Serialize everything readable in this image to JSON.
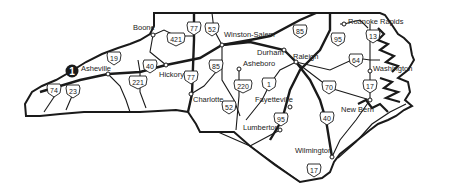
{
  "map": {
    "region": "North Carolina",
    "colors": {
      "ink": "#1a1a1a",
      "background": "#ffffff",
      "marker": "#1a1a1a"
    },
    "marker": {
      "label": "1",
      "x": 14,
      "y": 71
    },
    "cities": [
      {
        "id": "boone",
        "name": "Boone",
        "x": 133,
        "y": 30,
        "dot": [
          153,
          35
        ]
      },
      {
        "id": "winston-salem",
        "name": "Winston-Salem",
        "x": 224,
        "y": 37,
        "dot": [
          222,
          45
        ]
      },
      {
        "id": "roanoke-rapids",
        "name": "Roanoke Rapids",
        "x": 348,
        "y": 24,
        "dot": [
          344,
          24
        ]
      },
      {
        "id": "durham",
        "name": "Durham",
        "x": 257,
        "y": 55,
        "dot": [
          284,
          50
        ]
      },
      {
        "id": "raleigh",
        "name": "Raleigh",
        "x": 293,
        "y": 59,
        "dot": [
          296,
          62
        ]
      },
      {
        "id": "asheville",
        "name": "Asheville",
        "x": 81,
        "y": 71,
        "dot": [
          108,
          74
        ]
      },
      {
        "id": "hickory",
        "name": "Hickory",
        "x": 159,
        "y": 77,
        "dot": [
          166,
          65
        ]
      },
      {
        "id": "asheboro",
        "name": "Asheboro",
        "x": 243,
        "y": 66,
        "dot": [
          239,
          69
        ]
      },
      {
        "id": "washington",
        "name": "Washington",
        "x": 373,
        "y": 71,
        "dot": [
          370,
          71
        ]
      },
      {
        "id": "charlotte",
        "name": "Charlotte",
        "x": 193,
        "y": 102,
        "dot": [
          191,
          94
        ]
      },
      {
        "id": "fayetteville",
        "name": "Fayetteville",
        "x": 255,
        "y": 102,
        "dot": [
          290,
          107
        ]
      },
      {
        "id": "new-bern",
        "name": "New Bern",
        "x": 341,
        "y": 112,
        "dot": [
          370,
          100
        ]
      },
      {
        "id": "lumberton",
        "name": "Lumberton",
        "x": 243,
        "y": 130,
        "dot": [
          280,
          130
        ]
      },
      {
        "id": "wilmington",
        "name": "Wilmington",
        "x": 295,
        "y": 153,
        "dot": [
          332,
          157
        ]
      }
    ],
    "highways": [
      {
        "id": "us-77-north",
        "label": "77",
        "x": 194,
        "y": 28
      },
      {
        "id": "us-52-north",
        "label": "52",
        "x": 212,
        "y": 29
      },
      {
        "id": "us-421",
        "label": "421",
        "x": 176,
        "y": 39
      },
      {
        "id": "us-85-north",
        "label": "85",
        "x": 300,
        "y": 31
      },
      {
        "id": "us-95-north",
        "label": "95",
        "x": 338,
        "y": 39
      },
      {
        "id": "us-13",
        "label": "13",
        "x": 373,
        "y": 36
      },
      {
        "id": "us-19",
        "label": "19",
        "x": 114,
        "y": 58
      },
      {
        "id": "us-40-west",
        "label": "40",
        "x": 150,
        "y": 66
      },
      {
        "id": "us-85-mid",
        "label": "85",
        "x": 216,
        "y": 66
      },
      {
        "id": "us-64",
        "label": "64",
        "x": 356,
        "y": 60
      },
      {
        "id": "us-77-mid",
        "label": "77",
        "x": 191,
        "y": 77
      },
      {
        "id": "us-221",
        "label": "221",
        "x": 138,
        "y": 82
      },
      {
        "id": "us-220",
        "label": "220",
        "x": 243,
        "y": 86
      },
      {
        "id": "us-1",
        "label": "1",
        "x": 269,
        "y": 84
      },
      {
        "id": "us-70",
        "label": "70",
        "x": 329,
        "y": 87
      },
      {
        "id": "us-17-mid",
        "label": "17",
        "x": 370,
        "y": 86
      },
      {
        "id": "us-74",
        "label": "74",
        "x": 54,
        "y": 90
      },
      {
        "id": "us-23",
        "label": "23",
        "x": 73,
        "y": 91
      },
      {
        "id": "us-52-south",
        "label": "52",
        "x": 229,
        "y": 107
      },
      {
        "id": "us-95-south",
        "label": "95",
        "x": 281,
        "y": 119
      },
      {
        "id": "us-40-east",
        "label": "40",
        "x": 327,
        "y": 118
      },
      {
        "id": "us-17-south",
        "label": "17",
        "x": 314,
        "y": 170
      }
    ]
  }
}
